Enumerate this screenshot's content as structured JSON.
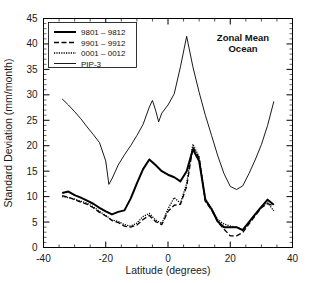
{
  "chart_data": {
    "type": "line",
    "title": "",
    "annotation": [
      "Zonal Mean",
      "Ocean"
    ],
    "xlabel": "Latitude (degrees)",
    "ylabel": "Standard Deviation (mm/month)",
    "xlim": [
      -40,
      40
    ],
    "ylim": [
      0,
      45
    ],
    "xticks": [
      -40,
      -20,
      0,
      20,
      40
    ],
    "yticks": [
      0,
      5,
      10,
      15,
      20,
      25,
      30,
      35,
      40,
      45
    ],
    "grid": false,
    "legend_position": "upper-left",
    "series": [
      {
        "name": "9801 - 9812",
        "style": "solid-thick",
        "x": [
          -34,
          -32,
          -30,
          -28,
          -26,
          -24,
          -22,
          -20,
          -18,
          -16,
          -14,
          -12,
          -10,
          -8,
          -6,
          -4,
          -2,
          0,
          2,
          4,
          6,
          8,
          10,
          12,
          14,
          16,
          18,
          20,
          22,
          24,
          26,
          28,
          30,
          32,
          34
        ],
        "y": [
          10.7,
          11.0,
          10.3,
          9.8,
          9.2,
          8.6,
          7.8,
          7.1,
          6.5,
          7.0,
          7.3,
          9.6,
          12.6,
          15.4,
          17.3,
          16.2,
          15.0,
          14.3,
          13.8,
          13.0,
          15.0,
          19.3,
          17.0,
          9.4,
          7.5,
          5.1,
          4.0,
          4.0,
          4.0,
          3.4,
          5.0,
          6.5,
          8.0,
          9.4,
          8.4
        ]
      },
      {
        "name": "9901 - 9912",
        "style": "dashed",
        "x": [
          -34,
          -32,
          -30,
          -28,
          -26,
          -24,
          -22,
          -20,
          -18,
          -16,
          -14,
          -12,
          -10,
          -8,
          -6,
          -4,
          -2,
          0,
          2,
          4,
          6,
          8,
          10,
          12,
          14,
          16,
          18,
          20,
          22,
          24,
          26,
          28,
          30,
          32,
          34
        ],
        "y": [
          10.2,
          9.9,
          9.4,
          8.9,
          8.5,
          7.8,
          6.9,
          6.2,
          5.3,
          4.9,
          4.2,
          4.0,
          4.4,
          5.5,
          6.3,
          5.1,
          4.5,
          7.1,
          8.3,
          8.5,
          12.0,
          19.7,
          17.6,
          9.0,
          7.4,
          5.0,
          3.6,
          2.3,
          2.3,
          2.9,
          4.6,
          6.2,
          7.8,
          8.6,
          8.2
        ]
      },
      {
        "name": "0001 - 0012",
        "style": "dotted",
        "x": [
          -34,
          -32,
          -30,
          -28,
          -26,
          -24,
          -22,
          -20,
          -18,
          -16,
          -14,
          -12,
          -10,
          -8,
          -6,
          -4,
          -2,
          0,
          2,
          4,
          6,
          8,
          10,
          12,
          14,
          16,
          18,
          20,
          22,
          24,
          26,
          28,
          30,
          32,
          34
        ],
        "y": [
          10.0,
          9.8,
          9.5,
          9.1,
          8.7,
          8.0,
          7.1,
          6.3,
          5.4,
          5.1,
          4.5,
          4.2,
          4.8,
          6.1,
          6.7,
          5.4,
          4.7,
          7.6,
          9.8,
          8.7,
          12.6,
          20.3,
          17.8,
          9.3,
          7.7,
          5.5,
          4.6,
          4.2,
          4.0,
          3.5,
          4.9,
          6.4,
          8.0,
          8.8,
          7.2
        ]
      },
      {
        "name": "PIP-3",
        "style": "solid-thin",
        "x": [
          -34,
          -32,
          -30,
          -28,
          -26,
          -24,
          -22,
          -20,
          -19,
          -18,
          -16,
          -14,
          -12,
          -10,
          -8,
          -6,
          -5,
          -4,
          -3,
          -2,
          0,
          2,
          4,
          6,
          8,
          10,
          12,
          14,
          16,
          18,
          20,
          22,
          24,
          26,
          28,
          30,
          32,
          34
        ],
        "y": [
          29.2,
          28.0,
          26.7,
          25.3,
          23.7,
          22.2,
          20.6,
          17.0,
          12.4,
          13.5,
          16.2,
          18.2,
          20.0,
          22.0,
          24.2,
          27.6,
          28.9,
          27.0,
          24.7,
          26.4,
          28.0,
          30.2,
          35.5,
          41.5,
          35.5,
          30.5,
          26.0,
          22.0,
          18.0,
          14.5,
          12.0,
          11.4,
          12.1,
          14.5,
          17.2,
          20.2,
          24.0,
          28.7
        ]
      }
    ]
  },
  "legend": {
    "items": [
      {
        "label": "9801 – 9812",
        "style": "solid-thick"
      },
      {
        "label": "9901 – 9912",
        "style": "dashed"
      },
      {
        "label": "0001 – 0012",
        "style": "dotted"
      },
      {
        "label": "PIP-3",
        "style": "solid-thin"
      }
    ]
  },
  "annotation": {
    "line1": "Zonal Mean",
    "line2": "Ocean"
  },
  "axes": {
    "xlabel": "Latitude (degrees)",
    "ylabel": "Standard Deviation (mm/month)",
    "xticks": [
      "-40",
      "-20",
      "0",
      "20",
      "40"
    ],
    "yticks": [
      "0",
      "5",
      "10",
      "15",
      "20",
      "25",
      "30",
      "35",
      "40",
      "45"
    ]
  }
}
